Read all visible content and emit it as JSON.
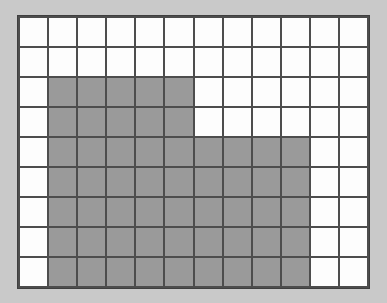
{
  "figure": {
    "kind": "shaded-grid",
    "background_color": "#c9c9c9",
    "grid_line_color": "#4d4d4d",
    "border_color": "#3f3f3f",
    "empty_cell_color": "#fdfdfd",
    "shaded_cell_color": "#9a9a9a"
  },
  "chart_data": {
    "type": "heatmap",
    "title": "",
    "subtitle": "",
    "xlabel": "",
    "ylabel": "",
    "columns": 12,
    "rows": 9,
    "legend": [],
    "annotations": [],
    "grid": true,
    "value_labels": {
      "0": "unshaded",
      "1": "shaded"
    },
    "colors": {
      "0": "#fdfdfd",
      "1": "#9a9a9a"
    },
    "shaded_count": 55,
    "unshaded_count": 53,
    "total_cells": 108,
    "values": [
      [
        0,
        0,
        0,
        0,
        0,
        0,
        0,
        0,
        0,
        0,
        0,
        0
      ],
      [
        0,
        0,
        0,
        0,
        0,
        0,
        0,
        0,
        0,
        0,
        0,
        0
      ],
      [
        0,
        1,
        1,
        1,
        1,
        1,
        0,
        0,
        0,
        0,
        0,
        0
      ],
      [
        0,
        1,
        1,
        1,
        1,
        1,
        0,
        0,
        0,
        0,
        0,
        0
      ],
      [
        0,
        1,
        1,
        1,
        1,
        1,
        1,
        1,
        1,
        1,
        0,
        0
      ],
      [
        0,
        1,
        1,
        1,
        1,
        1,
        1,
        1,
        1,
        1,
        0,
        0
      ],
      [
        0,
        1,
        1,
        1,
        1,
        1,
        1,
        1,
        1,
        1,
        0,
        0
      ],
      [
        0,
        1,
        1,
        1,
        1,
        1,
        1,
        1,
        1,
        1,
        0,
        0
      ],
      [
        0,
        1,
        1,
        1,
        1,
        1,
        1,
        1,
        1,
        1,
        0,
        0
      ]
    ]
  }
}
